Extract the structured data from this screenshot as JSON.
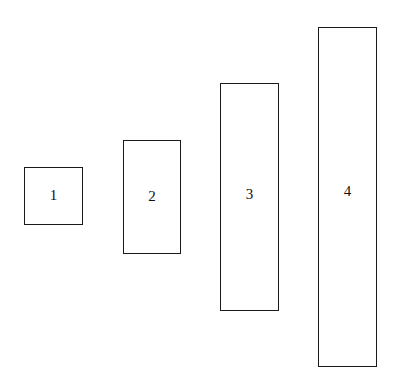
{
  "diagram": {
    "type": "size-comparison-rectangles",
    "boxes": [
      {
        "label": "1",
        "x": 24,
        "y": 167,
        "w": 59,
        "h": 58,
        "label_y": 22
      },
      {
        "label": "2",
        "x": 123,
        "y": 140,
        "w": 58,
        "h": 114,
        "label_y": 50
      },
      {
        "label": "3",
        "x": 220,
        "y": 83,
        "w": 59,
        "h": 228,
        "label_y": 104
      },
      {
        "label": "4",
        "x": 318,
        "y": 27,
        "w": 59,
        "h": 340,
        "label_y": 157
      }
    ]
  }
}
